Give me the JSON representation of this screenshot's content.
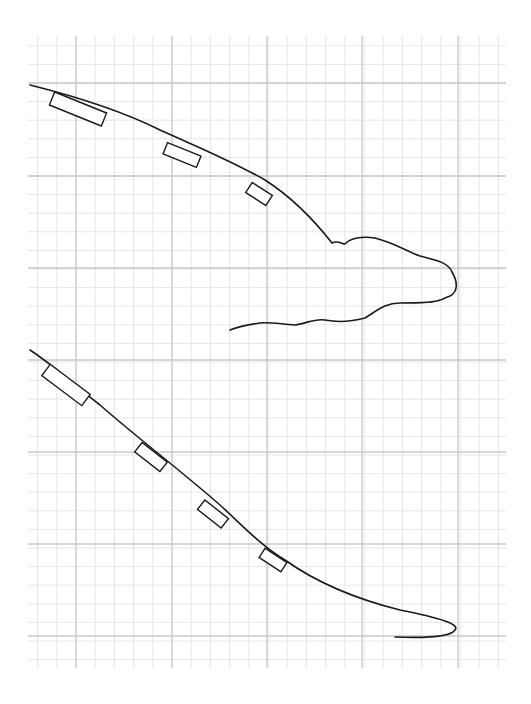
{
  "diagram": {
    "type": "sketch-on-graph-paper",
    "background": "#ffffff",
    "grid": {
      "x0": 28,
      "y0": 36,
      "x1": 506,
      "y1": 668,
      "major_x": [
        76,
        172,
        267,
        362,
        458
      ],
      "major_y": [
        83,
        176,
        268,
        360,
        452,
        544,
        636
      ],
      "minor_step": 19,
      "major_color": "#c9c9c9",
      "minor_color": "#e6e6e6"
    },
    "stroke_color": "#1a1a1a",
    "figures": [
      {
        "name": "upper-profile",
        "curve": "M30,85 C70,95 120,110 160,130 C200,148 230,160 265,180 C290,196 310,215 332,243 C338,240 342,244 345,244 C350,238 362,236 375,238 C395,243 408,252 420,256 C435,260 448,262 452,272 C458,282 458,292 450,296 C444,298 442,300 440,300 C436,302 420,303 400,303 C385,303 378,310 365,318 C350,322 335,322 325,320 C315,318 305,324 295,325 C280,324 270,322 260,323 C245,325 235,328 230,330",
        "rects": [
          {
            "cx": 78,
            "cy": 109,
            "w": 56,
            "h": 14,
            "angle": 22
          },
          {
            "cx": 182,
            "cy": 155,
            "w": 36,
            "h": 12,
            "angle": 22
          },
          {
            "cx": 259,
            "cy": 194,
            "w": 24,
            "h": 12,
            "angle": 33
          }
        ]
      },
      {
        "name": "lower-profile",
        "curve": "M30,350 C60,370 80,390 100,405 C140,440 180,470 220,505 C240,523 260,545 285,560 C320,585 360,600 400,610 C440,618 460,624 455,630 C450,638 420,638 395,637",
        "rects": [
          {
            "cx": 66,
            "cy": 385,
            "w": 50,
            "h": 14,
            "angle": 37
          },
          {
            "cx": 151,
            "cy": 457,
            "w": 32,
            "h": 12,
            "angle": 38
          },
          {
            "cx": 213,
            "cy": 514,
            "w": 30,
            "h": 12,
            "angle": 38
          },
          {
            "cx": 273,
            "cy": 560,
            "w": 26,
            "h": 11,
            "angle": 33
          }
        ]
      }
    ]
  }
}
